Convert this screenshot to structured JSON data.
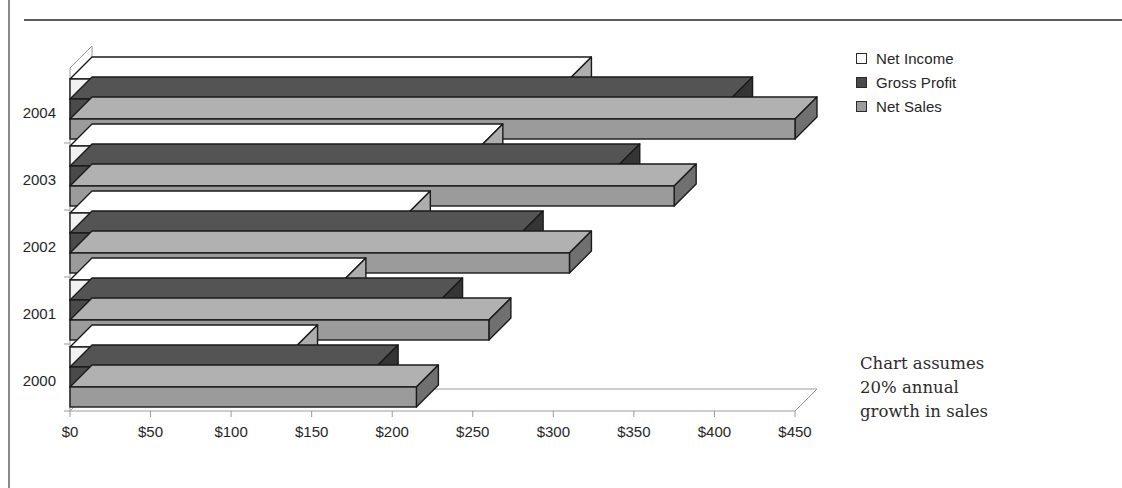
{
  "chart_data": {
    "type": "bar",
    "orientation": "horizontal",
    "style": "3d-stacked-rows",
    "title": "",
    "xlabel": "",
    "ylabel": "",
    "categories": [
      "2000",
      "2001",
      "2002",
      "2003",
      "2004"
    ],
    "series": [
      {
        "name": "Net Income",
        "values": [
          140,
          170,
          210,
          255,
          310
        ],
        "color": "#f2f2f2"
      },
      {
        "name": "Gross Profit",
        "values": [
          190,
          230,
          280,
          340,
          410
        ],
        "color": "#4a4a4a"
      },
      {
        "name": "Net Sales",
        "values": [
          215,
          260,
          310,
          375,
          450
        ],
        "color": "#9b9b9b"
      }
    ],
    "xlim": [
      0,
      450
    ],
    "xticks": [
      0,
      50,
      100,
      150,
      200,
      250,
      300,
      350,
      400,
      450
    ],
    "xtick_labels": [
      "$0",
      "$50",
      "$100",
      "$150",
      "$200",
      "$250",
      "$300",
      "$350",
      "$400",
      "$450"
    ],
    "ytick_labels": [
      "2000",
      "2001",
      "2002",
      "2003",
      "2004"
    ],
    "grid": false,
    "legend_position": "right",
    "annotation": "Chart assumes 20% annual growth in sales"
  },
  "legend": {
    "items": [
      {
        "label": "Net Income",
        "swatch_icon": "legend-swatch-net-income"
      },
      {
        "label": "Gross Profit",
        "swatch_icon": "legend-swatch-gross-profit"
      },
      {
        "label": "Net Sales",
        "swatch_icon": "legend-swatch-net-sales"
      }
    ]
  },
  "annotation": {
    "line1": "Chart assumes",
    "line2": "20% annual",
    "line3": "growth in sales"
  },
  "colors": {
    "net_income": "#f2f2f2",
    "gross_profit": "#4a4a4a",
    "net_sales": "#9b9b9b",
    "bar_outline": "#1a1a1a",
    "axis": "#9a9a9a",
    "text": "#262626",
    "rule": "#5c5c5c"
  }
}
